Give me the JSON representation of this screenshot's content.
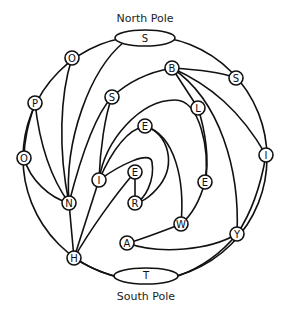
{
  "diagram": {
    "north_pole": {
      "label": "North Pole",
      "letter": "S"
    },
    "south_pole": {
      "label": "South Pole",
      "letter": "T"
    },
    "nodes": [
      {
        "id": "o_top",
        "letter": "O"
      },
      {
        "id": "p",
        "letter": "P"
      },
      {
        "id": "o_left",
        "letter": "O"
      },
      {
        "id": "n",
        "letter": "N"
      },
      {
        "id": "h",
        "letter": "H"
      },
      {
        "id": "s_mid",
        "letter": "S"
      },
      {
        "id": "i_left",
        "letter": "I"
      },
      {
        "id": "e_inner",
        "letter": "E"
      },
      {
        "id": "e_core",
        "letter": "E"
      },
      {
        "id": "r",
        "letter": "R"
      },
      {
        "id": "b",
        "letter": "B"
      },
      {
        "id": "s_right",
        "letter": "S"
      },
      {
        "id": "l",
        "letter": "L"
      },
      {
        "id": "i_right",
        "letter": "I"
      },
      {
        "id": "e_right",
        "letter": "E"
      },
      {
        "id": "w",
        "letter": "W"
      },
      {
        "id": "a",
        "letter": "A"
      },
      {
        "id": "y",
        "letter": "Y"
      }
    ]
  }
}
